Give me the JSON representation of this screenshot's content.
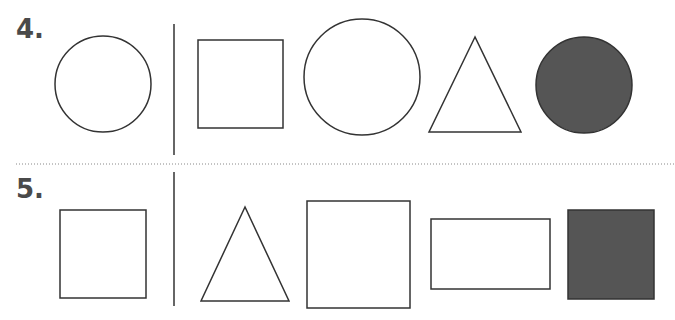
{
  "problems": [
    {
      "number": "4.",
      "example": "circle",
      "choices": [
        "square",
        "circle",
        "triangle",
        "filled-circle"
      ]
    },
    {
      "number": "5.",
      "example": "square",
      "choices": [
        "triangle",
        "square",
        "rectangle",
        "filled-square"
      ]
    }
  ],
  "colors": {
    "stroke": "#333333",
    "fill": "#555555",
    "divider": "#888888"
  }
}
